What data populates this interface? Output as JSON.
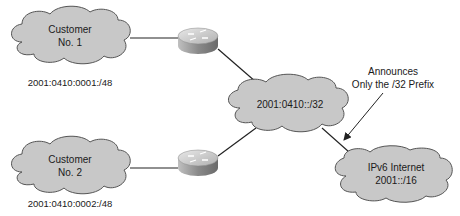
{
  "diagram": {
    "colors": {
      "cloud_fill": "#c8c8c8",
      "cloud_stroke": "#555555",
      "line": "#222222",
      "router_top": "#d6d6d6",
      "router_side": "#a8a8a8"
    },
    "clouds": [
      {
        "id": "customer1",
        "line1": "Customer",
        "line2": "No. 1",
        "prefix": "2001:0410:0001:/48"
      },
      {
        "id": "customer2",
        "line1": "Customer",
        "line2": "No. 2",
        "prefix": "2001:0410:0002:/48"
      },
      {
        "id": "isp",
        "label": "2001:0410::/32"
      },
      {
        "id": "internet",
        "line1": "IPv6 Internet",
        "line2": "2001::/16"
      }
    ],
    "routers": [
      {
        "id": "router1",
        "icon": "router-icon"
      },
      {
        "id": "router2",
        "icon": "router-icon"
      }
    ],
    "annotation": {
      "line1": "Announces",
      "line2": "Only the /32 Prefix"
    }
  }
}
